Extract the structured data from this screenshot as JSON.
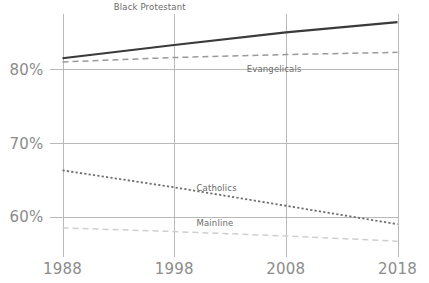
{
  "chart_data": {
    "type": "line",
    "title": "",
    "subtitle": "",
    "xlabel": "",
    "ylabel": "",
    "x": [
      1988,
      1998,
      2008,
      2018
    ],
    "xlim": [
      1988,
      2018
    ],
    "ylim": [
      55.5,
      87.5
    ],
    "x_tick_labels": [
      "1988",
      "1998",
      "2008",
      "2018"
    ],
    "y_ticks": [
      60,
      70,
      80
    ],
    "y_tick_labels": [
      "60%",
      "70%",
      "80%"
    ],
    "grid": "both",
    "legend": "inline-labels",
    "series": [
      {
        "name": "Black Protestant",
        "values": [
          81.5,
          83.3,
          85.0,
          86.4
        ],
        "color": "#3a3a3a",
        "style": "solid",
        "width": 2.2,
        "label_x": 1992.6,
        "label_y": 88.1,
        "label_anchor": "start"
      },
      {
        "name": "Evangelicals",
        "values": [
          81.0,
          81.6,
          82.0,
          82.3
        ],
        "color": "#9a9a9a",
        "style": "dashed",
        "width": 1.5,
        "label_x": 2004.5,
        "label_y": 79.6,
        "label_anchor": "start"
      },
      {
        "name": "Catholics",
        "values": [
          66.3,
          64.0,
          61.5,
          59.0
        ],
        "color": "#6f6f6f",
        "style": "dotted",
        "width": 1.8,
        "label_x": 2000.0,
        "label_y": 63.5,
        "label_anchor": "start"
      },
      {
        "name": "Mainline",
        "values": [
          58.5,
          58.0,
          57.4,
          56.7
        ],
        "color": "#cfcfcf",
        "style": "dashed",
        "width": 1.5,
        "label_x": 2000.0,
        "label_y": 58.8,
        "label_anchor": "start"
      }
    ]
  },
  "colors": {
    "background": "#ffffff",
    "grid": "#b9b9b9",
    "tick_text": "#8c8c8c",
    "label_text": "#6b6b6b"
  }
}
